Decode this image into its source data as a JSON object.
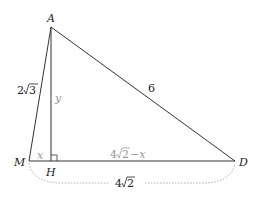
{
  "figure": {
    "type": "geometry-triangle",
    "points": {
      "A": {
        "label": "A",
        "x": 51,
        "y": 27
      },
      "M": {
        "label": "M",
        "x": 29,
        "y": 161
      },
      "H": {
        "label": "H",
        "x": 50,
        "y": 161
      },
      "D": {
        "label": "D",
        "x": 235,
        "y": 161
      }
    },
    "labels": {
      "AM": "2√3",
      "AD": "6",
      "AH": "y",
      "MH": "x",
      "HD": "4√2−x",
      "MD_brace": "4√2"
    },
    "sqrt_parts": {
      "AM_coef": "2",
      "AM_rad": "3",
      "HD_coef": "4",
      "HD_rad": "2",
      "HD_tail": "−x",
      "MD_coef": "4",
      "MD_rad": "2"
    },
    "colors": {
      "line": "#333333",
      "aux_text": "#999999",
      "brace": "#999999"
    }
  }
}
